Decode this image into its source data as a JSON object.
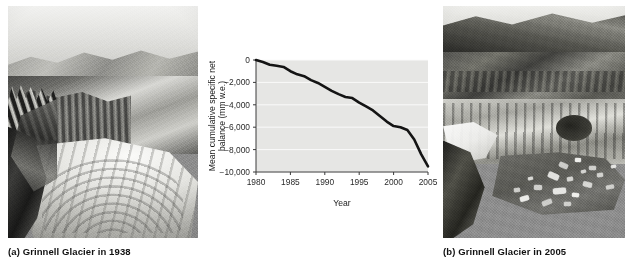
{
  "figure": {
    "panels": [
      {
        "id": "a",
        "caption": "(a) Grinnell Glacier in 1938",
        "photo_alt": "black-and-white aerial photograph of Grinnell Glacier filling the cirque in 1938"
      },
      {
        "id": "b",
        "caption": "(b) Grinnell Glacier in 2005",
        "photo_alt": "black-and-white aerial photograph of Grinnell Glacier greatly reduced with a proglacial lake containing floating ice in 2005"
      }
    ]
  },
  "chart_data": {
    "type": "line",
    "title": "",
    "xlabel": "Year",
    "ylabel": "Mean cumulative specific net balance (mm w.e.)",
    "xlim": [
      1980,
      2005
    ],
    "ylim": [
      -10000,
      0
    ],
    "xticks": [
      1980,
      1985,
      1990,
      1995,
      2000,
      2005
    ],
    "xticklabels": [
      "1980",
      "1985",
      "1990",
      "1995",
      "2000",
      "2005"
    ],
    "yticks": [
      0,
      -2000,
      -4000,
      -6000,
      -8000,
      -10000
    ],
    "yticklabels": [
      "0",
      "−2,000",
      "−4,000",
      "−6,000",
      "−8,000",
      "−10,000"
    ],
    "grid": "horizontal",
    "legend": "none",
    "line_color": "#141414",
    "plot_bg": "#e6e6e4",
    "gridline_color": "#fafafa",
    "series": [
      {
        "name": "Mean cumulative specific net balance",
        "x": [
          1980,
          1981,
          1982,
          1983,
          1984,
          1985,
          1986,
          1987,
          1988,
          1989,
          1990,
          1991,
          1992,
          1993,
          1994,
          1995,
          1996,
          1997,
          1998,
          1999,
          2000,
          2001,
          2002,
          2003,
          2004,
          2005
        ],
        "values": [
          0,
          -180,
          -420,
          -520,
          -620,
          -1000,
          -1280,
          -1450,
          -1800,
          -2050,
          -2400,
          -2750,
          -3050,
          -3300,
          -3400,
          -3800,
          -4150,
          -4500,
          -5000,
          -5500,
          -5900,
          -6000,
          -6250,
          -7100,
          -8400,
          -9500
        ]
      }
    ]
  }
}
